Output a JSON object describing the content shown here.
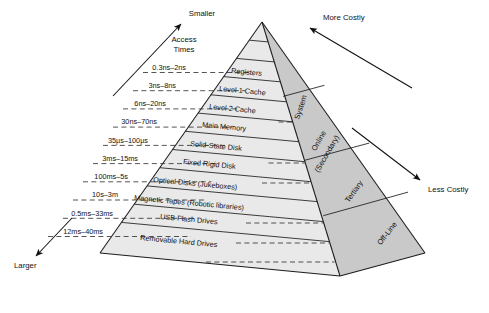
{
  "diagram": {
    "apex": {
      "x": 262,
      "y": 22
    },
    "colors": {
      "front_face": "#e9e9e9",
      "right_face": "#c9c9c9",
      "outline": "#1c1c1c",
      "dashed": "#2a2a2a",
      "text": "#111111",
      "background": "#ffffff"
    },
    "axis_labels": {
      "top_left": "Smaller",
      "top_left_secondary_line1": "Access",
      "top_left_secondary_line2": "Times",
      "top_right": "More Costly",
      "bottom_left": "Larger",
      "bottom_right": "Less Costly"
    },
    "tiers": [
      {
        "name": "Registers",
        "access_time": "0.3ns–2ns"
      },
      {
        "name": "Level 1 Cache",
        "access_time": "3ns–8ns"
      },
      {
        "name": "Level 2 Cache",
        "access_time": "6ns–20ns"
      },
      {
        "name": "Main Memory",
        "access_time": "30ns–70ns"
      },
      {
        "name": "Solid-State Disk",
        "access_time": "35µs–100µs"
      },
      {
        "name": "Fixed Rigid Disk",
        "access_time": "3ms–15ms"
      },
      {
        "name": "Optical Disks (Jukeboxes)",
        "access_time": "100ms–5s"
      },
      {
        "name": "Magnetic Tapes (Robotic libraries)",
        "access_time": "10s–3m"
      },
      {
        "name": "USB Flash Drives",
        "access_time": "0.5ms–33ms"
      },
      {
        "name": "Removable Hard Drives",
        "access_time": "12ms–40ms"
      }
    ],
    "side_faces": [
      {
        "label": "System"
      },
      {
        "label": "Online"
      },
      {
        "label": "(Secondary)"
      },
      {
        "label": "Tertiary"
      },
      {
        "label": "Off-Line"
      }
    ]
  }
}
